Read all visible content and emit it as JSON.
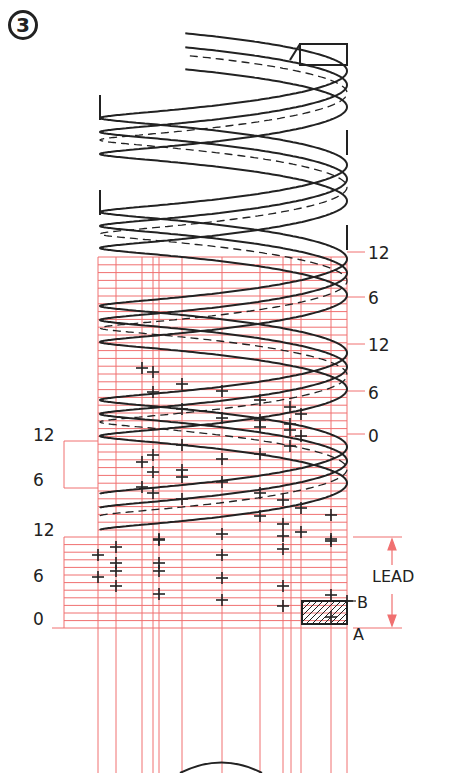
{
  "figure": {
    "step_badge": "3",
    "colors": {
      "construction": "#f07070",
      "ink": "#222222"
    }
  },
  "right_scale": {
    "labels": [
      {
        "text": "12",
        "y": 254
      },
      {
        "text": "6",
        "y": 299
      },
      {
        "text": "12",
        "y": 346
      },
      {
        "text": "6",
        "y": 394
      },
      {
        "text": "0",
        "y": 437
      }
    ]
  },
  "left_scale": {
    "labels": [
      {
        "text": "12",
        "y": 436
      },
      {
        "text": "6",
        "y": 481
      },
      {
        "text": "12",
        "y": 531
      },
      {
        "text": "6",
        "y": 577
      },
      {
        "text": "0",
        "y": 620
      }
    ]
  },
  "lead_dimension": {
    "label": "LEAD",
    "point_b": "B",
    "point_a": "A"
  },
  "grid": {
    "vertical_x": [
      98,
      116,
      142,
      153,
      159,
      182,
      222,
      260,
      283,
      291,
      301,
      331,
      347
    ],
    "upper_top": 257,
    "upper_bottom": 537,
    "row_step": 7.8,
    "lower_top": 537,
    "lower_bottom": 628
  }
}
